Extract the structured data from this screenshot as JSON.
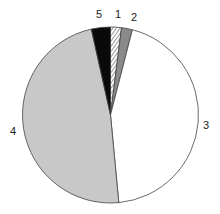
{
  "chart_data": {
    "type": "pie",
    "title": "",
    "start_angle_deg": 0,
    "direction": "clockwise",
    "slices": [
      {
        "label": "1",
        "value": 2.0,
        "fill": "hatched",
        "color": "#ffffff"
      },
      {
        "label": "2",
        "value": 2.0,
        "fill": "solid",
        "color": "#8a8a8a"
      },
      {
        "label": "3",
        "value": 44.5,
        "fill": "solid",
        "color": "#ffffff"
      },
      {
        "label": "4",
        "value": 48.0,
        "fill": "solid",
        "color": "#c8c8c8"
      },
      {
        "label": "5",
        "value": 3.5,
        "fill": "solid",
        "color": "#0a0a0a"
      }
    ],
    "labels": [
      "1",
      "2",
      "3",
      "4",
      "5"
    ],
    "values": [
      2.0,
      2.0,
      44.5,
      48.0,
      3.5
    ],
    "legend": "none (labels placed outside slices)"
  }
}
